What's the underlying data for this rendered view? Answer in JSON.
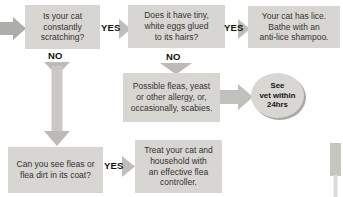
{
  "palette": {
    "background": "#ffffff",
    "box_fill": "#d7d6d2",
    "arrow_fill": "#b9b8b4",
    "arrow_shaft": "#c9c8c4",
    "entry_arrow": "#aeada9",
    "badge_fill": "#d8d7d3",
    "badge_shadow": "#a9a8a4",
    "box_text": "#34332f",
    "label_text": "#12110d",
    "page_edge": "#c6c5c2"
  },
  "flowchart": {
    "q_scratching": "Is your cat\nconstantly\nscratching?",
    "q_eggs": "Does it have tiny,\nwhite eggs glued\nto its hairs?",
    "r_lice": "Your cat has lice.\nBathe with an\nanti-lice shampoo.",
    "r_allergy": "Possible fleas, yeast\nor other allergy, or,\noccasionally, scabies.",
    "q_flea_dirt": "Can you see fleas or\nflea dirt in its coat?",
    "r_treat": "Treat your cat and\nhousehold with\nan effective flea\ncontroller.",
    "vet_badge": "See\nvet within\n24hrs",
    "labels": {
      "yes_q_scratching": "YES",
      "no_q_scratching": "NO",
      "yes_q_eggs": "YES",
      "no_q_eggs": "NO",
      "yes_q_flea_dirt": "YES"
    }
  }
}
